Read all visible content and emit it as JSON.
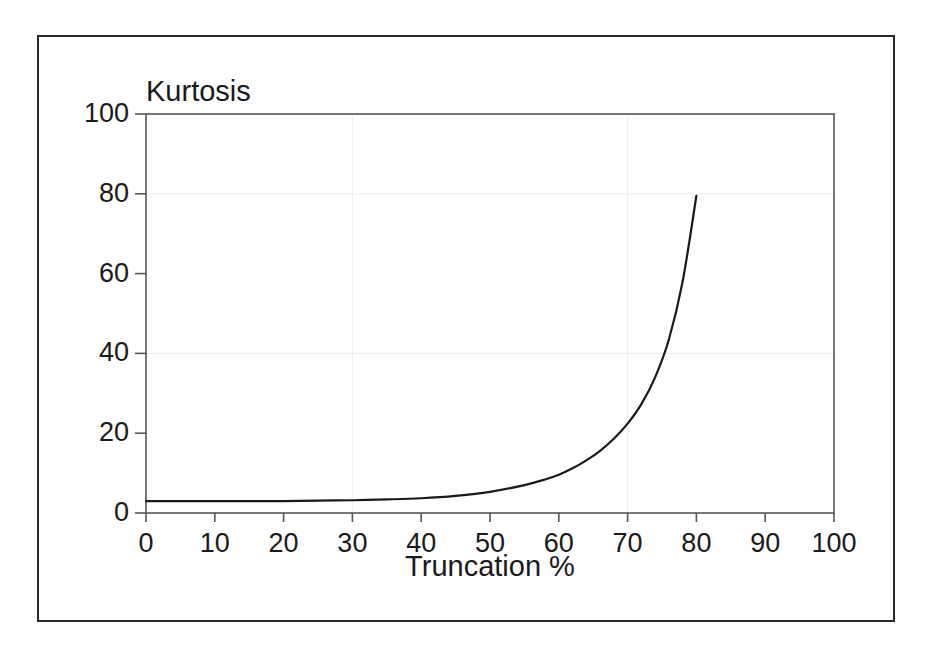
{
  "figure": {
    "background_color": "#ffffff",
    "frame_color": "#2b2b2b",
    "axis_color": "#555555",
    "curve_color": "#1a1a1a",
    "gridline_color": "#f0f0f0"
  },
  "chart_data": {
    "type": "line",
    "title": "",
    "xlabel": "Truncation %",
    "ylabel": "Kurtosis",
    "xlim": [
      0,
      100
    ],
    "ylim": [
      0,
      100
    ],
    "xticks": [
      0,
      10,
      20,
      30,
      40,
      50,
      60,
      70,
      80,
      90,
      100
    ],
    "xticklabels": [
      "0",
      "10",
      "20",
      "30",
      "40",
      "50",
      "60",
      "70",
      "80",
      "90",
      "100"
    ],
    "yticks": [
      0,
      20,
      40,
      60,
      80,
      100
    ],
    "yticklabels": [
      "0",
      "20",
      "40",
      "60",
      "80",
      "100"
    ],
    "grid": "faint",
    "legend": "none",
    "series": [
      {
        "name": "Kurtosis vs Truncation",
        "x": [
          0,
          5,
          10,
          15,
          20,
          25,
          30,
          35,
          40,
          45,
          50,
          55,
          58,
          60,
          62,
          64,
          66,
          68,
          70,
          72,
          74,
          76,
          78,
          80
        ],
        "y": [
          3.0,
          3.0,
          3.0,
          3.0,
          3.0,
          3.1,
          3.2,
          3.4,
          3.7,
          4.3,
          5.3,
          7.0,
          8.4,
          9.6,
          11.2,
          13.2,
          15.6,
          18.6,
          22.4,
          27.3,
          34.0,
          43.5,
          58.0,
          79.5
        ]
      }
    ]
  },
  "axis_titles": {
    "y": "Kurtosis",
    "x": "Truncation %"
  }
}
